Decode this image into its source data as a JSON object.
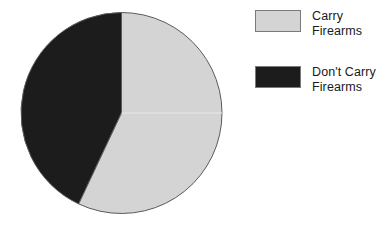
{
  "chart_data": {
    "type": "pie",
    "title": "",
    "subtitle": "",
    "xlabel": "",
    "ylabel": "",
    "grid": false,
    "legend_position": "right",
    "start_angle_deg": 0,
    "direction": "clockwise",
    "categories": [
      "Carry Firearms",
      "Don't Carry Firearms"
    ],
    "values": [
      57,
      43
    ],
    "value_unit": "percent",
    "slices": [
      {
        "label": "Carry Firearms",
        "label_line1": "Carry",
        "label_line2": "Firearms",
        "value": 57,
        "angle_deg": 205,
        "color": "#d4d4d4",
        "edge_color": "#5a5a5a"
      },
      {
        "label": "Don't Carry Firearms",
        "label_line1": "Don't Carry",
        "label_line2": "Firearms",
        "value": 43,
        "angle_deg": 155,
        "color": "#1c1c1c",
        "edge_color": "#5a5a5a"
      }
    ],
    "annotations": []
  },
  "legend": {
    "items": [
      {
        "label": "Carry\nFirearms",
        "color": "#d4d4d4"
      },
      {
        "label": "Don't Carry\nFirearms",
        "color": "#1c1c1c"
      }
    ]
  },
  "colors": {
    "background": "#ffffff",
    "light_slice": "#d4d4d4",
    "dark_slice": "#1c1c1c",
    "outline": "#5a5a5a",
    "text": "#1a1a1a"
  }
}
